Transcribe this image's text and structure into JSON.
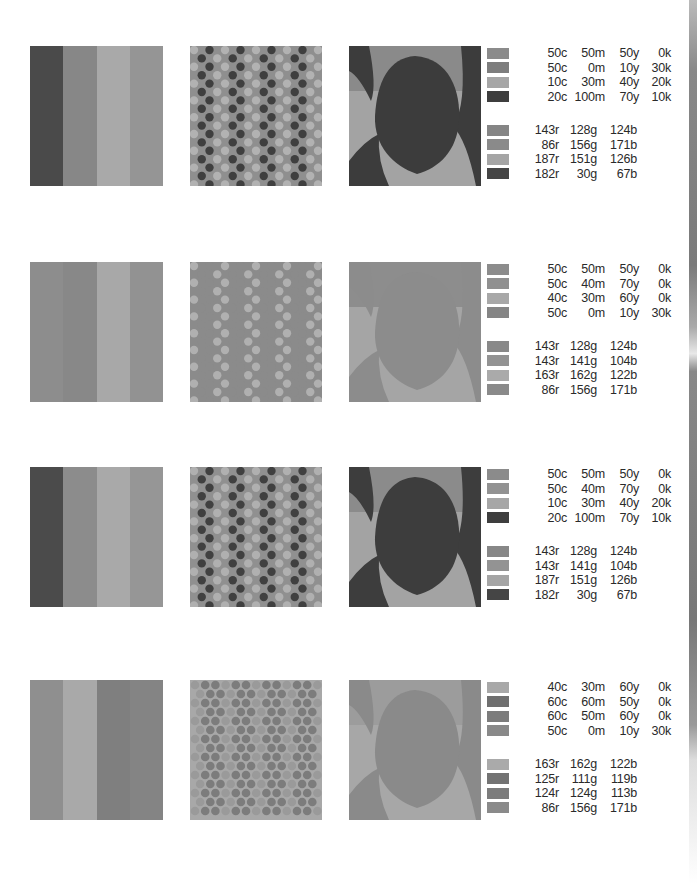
{
  "page": {
    "edge_bar_color": "#7a7a7a"
  },
  "rows": [
    {
      "stripes": [
        "#4a4a4a",
        "#878787",
        "#a9a9a9",
        "#959595"
      ],
      "dots": {
        "bg": "#8f8f8f",
        "dark": "#3f3f3f",
        "light": "#b2b2b2",
        "density": "sparse"
      },
      "shapes": {
        "bg": "#a3a3a3",
        "shape": "#3c3c3c",
        "top": "#8a8a8a"
      },
      "cmyk": [
        {
          "swatch": "#8b8b8b",
          "c": "50c",
          "m": "50m",
          "y": "50y",
          "k": "0k"
        },
        {
          "swatch": "#7d7d7d",
          "c": "50c",
          "m": "0m",
          "y": "10y",
          "k": "30k"
        },
        {
          "swatch": "#a6a6a6",
          "c": "10c",
          "m": "30m",
          "y": "40y",
          "k": "20k"
        },
        {
          "swatch": "#3e3e3e",
          "c": "20c",
          "m": "100m",
          "y": "70y",
          "k": "10k"
        }
      ],
      "rgb": [
        {
          "swatch": "#858585",
          "r": "143r",
          "g": "128g",
          "b": "124b"
        },
        {
          "swatch": "#8a8a8a",
          "r": "86r",
          "g": "156g",
          "b": "171b"
        },
        {
          "swatch": "#a5a5a5",
          "r": "187r",
          "g": "151g",
          "b": "126b"
        },
        {
          "swatch": "#454545",
          "r": "182r",
          "g": "30g",
          "b": "67b"
        }
      ]
    },
    {
      "stripes": [
        "#8d8d8d",
        "#888888",
        "#a8a8a8",
        "#929292"
      ],
      "dots": {
        "bg": "#8b8b8b",
        "dark": "#8b8b8b",
        "light": "#b0b0b0",
        "density": "sparse"
      },
      "shapes": {
        "bg": "#a5a5a5",
        "shape": "#8c8c8c",
        "top": "#8d8d8d"
      },
      "cmyk": [
        {
          "swatch": "#8c8c8c",
          "c": "50c",
          "m": "50m",
          "y": "50y",
          "k": "0k"
        },
        {
          "swatch": "#909090",
          "c": "50c",
          "m": "40m",
          "y": "70y",
          "k": "0k"
        },
        {
          "swatch": "#a8a8a8",
          "c": "40c",
          "m": "30m",
          "y": "60y",
          "k": "0k"
        },
        {
          "swatch": "#858585",
          "c": "50c",
          "m": "0m",
          "y": "10y",
          "k": "30k"
        }
      ],
      "rgb": [
        {
          "swatch": "#898989",
          "r": "143r",
          "g": "128g",
          "b": "124b"
        },
        {
          "swatch": "#939393",
          "r": "143r",
          "g": "141g",
          "b": "104b"
        },
        {
          "swatch": "#aaaaaa",
          "r": "163r",
          "g": "162g",
          "b": "122b"
        },
        {
          "swatch": "#8a8a8a",
          "r": "86r",
          "g": "156g",
          "b": "171b"
        }
      ]
    },
    {
      "stripes": [
        "#4b4b4b",
        "#8c8c8c",
        "#a9a9a9",
        "#969696"
      ],
      "dots": {
        "bg": "#909090",
        "dark": "#404040",
        "light": "#b0b0b0",
        "density": "sparse"
      },
      "shapes": {
        "bg": "#a3a3a3",
        "shape": "#3d3d3d",
        "top": "#8b8b8b"
      },
      "cmyk": [
        {
          "swatch": "#8b8b8b",
          "c": "50c",
          "m": "50m",
          "y": "50y",
          "k": "0k"
        },
        {
          "swatch": "#929292",
          "c": "50c",
          "m": "40m",
          "y": "70y",
          "k": "0k"
        },
        {
          "swatch": "#a6a6a6",
          "c": "10c",
          "m": "30m",
          "y": "40y",
          "k": "20k"
        },
        {
          "swatch": "#3e3e3e",
          "c": "20c",
          "m": "100m",
          "y": "70y",
          "k": "10k"
        }
      ],
      "rgb": [
        {
          "swatch": "#878787",
          "r": "143r",
          "g": "128g",
          "b": "124b"
        },
        {
          "swatch": "#939393",
          "r": "143r",
          "g": "141g",
          "b": "104b"
        },
        {
          "swatch": "#a5a5a5",
          "r": "187r",
          "g": "151g",
          "b": "126b"
        },
        {
          "swatch": "#454545",
          "r": "182r",
          "g": "30g",
          "b": "67b"
        }
      ]
    },
    {
      "stripes": [
        "#8f8f8f",
        "#a9a9a9",
        "#7f7f7f",
        "#848484"
      ],
      "dots": {
        "bg": "#a8a8a8",
        "dark": "#7c7c7c",
        "light": "#9a9a9a",
        "density": "dense"
      },
      "shapes": {
        "bg": "#a7a7a7",
        "shape": "#8a8a8a",
        "top": "#9c9c9c"
      },
      "cmyk": [
        {
          "swatch": "#a8a8a8",
          "c": "40c",
          "m": "30m",
          "y": "60y",
          "k": "0k"
        },
        {
          "swatch": "#6f6f6f",
          "c": "60c",
          "m": "60m",
          "y": "50y",
          "k": "0k"
        },
        {
          "swatch": "#7c7c7c",
          "c": "60c",
          "m": "50m",
          "y": "60y",
          "k": "0k"
        },
        {
          "swatch": "#898989",
          "c": "50c",
          "m": "0m",
          "y": "10y",
          "k": "30k"
        }
      ],
      "rgb": [
        {
          "swatch": "#aaaaaa",
          "r": "163r",
          "g": "162g",
          "b": "122b"
        },
        {
          "swatch": "#737373",
          "r": "125r",
          "g": "111g",
          "b": "119b"
        },
        {
          "swatch": "#7c7c7c",
          "r": "124r",
          "g": "124g",
          "b": "113b"
        },
        {
          "swatch": "#8a8a8a",
          "r": "86r",
          "g": "156g",
          "b": "171b"
        }
      ]
    }
  ]
}
